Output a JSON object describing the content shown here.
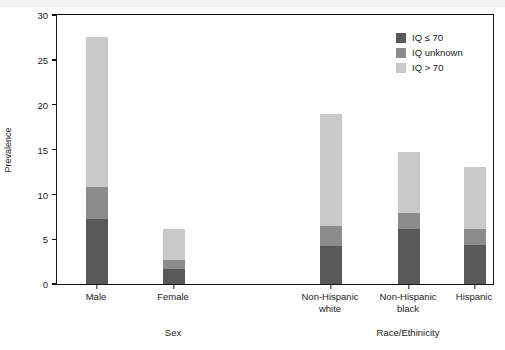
{
  "chart_data": {
    "type": "bar",
    "stacked": true,
    "title": "",
    "xlabel": "",
    "ylabel": "Prevalence",
    "ylim": [
      0,
      30
    ],
    "yticks": [
      0,
      5,
      10,
      15,
      20,
      25,
      30
    ],
    "grid": false,
    "legend_position": "top-right",
    "categories": [
      "Male",
      "Female",
      "Non-Hispanic white",
      "Non-Hispanic black",
      "Hispanic"
    ],
    "category_lines": [
      [
        "Male"
      ],
      [
        "Female"
      ],
      [
        "Non-Hispanic",
        "white"
      ],
      [
        "Non-Hispanic",
        "black"
      ],
      [
        "Hispanic"
      ]
    ],
    "series": [
      {
        "name": "IQ ≤ 70",
        "color": "#595959",
        "values": [
          7.2,
          1.7,
          4.2,
          6.1,
          4.3
        ]
      },
      {
        "name": "IQ unknown",
        "color": "#8c8c8c",
        "values": [
          3.6,
          1.0,
          2.3,
          1.8,
          1.8
        ]
      },
      {
        "name": "IQ > 70",
        "color": "#c9c9c9",
        "values": [
          16.7,
          3.4,
          12.5,
          6.8,
          7.0
        ]
      }
    ],
    "totals": [
      27.5,
      6.1,
      19.0,
      14.7,
      13.1
    ],
    "groups": [
      {
        "label": "Sex",
        "categories": [
          "Male",
          "Female"
        ]
      },
      {
        "label": "Race/Ethinicity",
        "categories": [
          "Non-Hispanic white",
          "Non-Hispanic black",
          "Hispanic"
        ]
      }
    ]
  },
  "legend": {
    "entries": [
      {
        "label": "IQ ≤ 70"
      },
      {
        "label": "IQ unknown"
      },
      {
        "label": "IQ > 70"
      }
    ]
  },
  "axis": {
    "y_title": "Prevalence",
    "y_tick_labels": [
      "30",
      "25",
      "20",
      "15",
      "10",
      "5",
      "0"
    ]
  }
}
